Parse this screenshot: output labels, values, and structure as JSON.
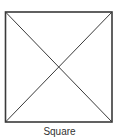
{
  "diagram": {
    "shape": "square",
    "caption": "Square",
    "features": [
      "outline",
      "diagonal-top-left-to-bottom-right",
      "diagonal-top-right-to-bottom-left"
    ],
    "colors": {
      "stroke": "#3a3a3a",
      "background": "#ffffff",
      "caption": "#333333"
    }
  }
}
